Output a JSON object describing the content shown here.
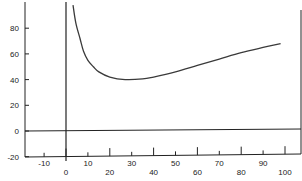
{
  "chart_data": {
    "type": "line",
    "title": "",
    "xlabel": "",
    "ylabel": "",
    "xlim": [
      -15,
      105
    ],
    "ylim": [
      -20,
      100
    ],
    "x_ticks": [
      -10,
      0,
      10,
      20,
      30,
      40,
      50,
      60,
      70,
      80,
      90,
      100
    ],
    "y_ticks": [
      -20,
      0,
      20,
      40,
      60,
      80
    ],
    "grid": false,
    "legend": null,
    "reference_lines": [
      {
        "orientation": "vertical",
        "x": 0
      },
      {
        "orientation": "horizontal",
        "y": 0
      }
    ],
    "series": [
      {
        "name": "curve",
        "x": [
          3.2,
          4.5,
          6.4,
          8,
          10,
          12.5,
          15,
          20,
          27,
          35,
          40,
          50,
          60,
          70,
          80,
          90,
          98
        ],
        "values": [
          98,
          84,
          72,
          62,
          55,
          50,
          46,
          42,
          40,
          40.5,
          42,
          46,
          51,
          56,
          61,
          65,
          68
        ]
      }
    ]
  },
  "colors": {
    "line": "#3a3a3a",
    "axis": "#222222",
    "background": "#ffffff"
  }
}
